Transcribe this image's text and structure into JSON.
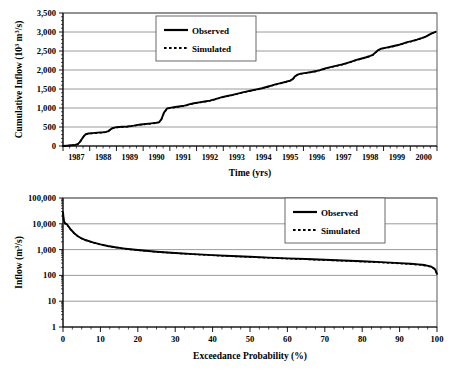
{
  "figure": {
    "title": "",
    "panels": [
      "cumulative-inflow-timeseries",
      "inflow-exceedance-probability"
    ]
  },
  "chart_data": [
    {
      "type": "line",
      "id": "cumulative-inflow",
      "title": "",
      "xlabel": "Time (yrs)",
      "ylabel": "Cumulative Inflow (10³ m³/s)",
      "ylabel_parts": {
        "main": "Cumulative Inflow (10",
        "sup": "3",
        "tail": "m",
        "sup2": "3",
        "tail2": "/s)"
      },
      "xlim": [
        1987,
        2001
      ],
      "ylim": [
        0,
        3500
      ],
      "yticks": [
        0,
        500,
        1000,
        1500,
        2000,
        2500,
        3000,
        3500
      ],
      "ytick_labels": [
        "0",
        "500",
        "1,000",
        "1,500",
        "2,000",
        "2,500",
        "3,000",
        "3,500"
      ],
      "xticks": [
        1987,
        1988,
        1989,
        1990,
        1991,
        1992,
        1993,
        1994,
        1995,
        1996,
        1997,
        1998,
        1999,
        2000
      ],
      "xtick_labels": [
        "1987",
        "1988",
        "1989",
        "1990",
        "1991",
        "1992",
        "1993",
        "1994",
        "1995",
        "1996",
        "1997",
        "1998",
        "1999",
        "2000"
      ],
      "grid": "horizontal",
      "legend_position": "top-center",
      "series": [
        {
          "name": "Observed",
          "style": "solid",
          "x": [
            1987.0,
            1987.15,
            1987.3,
            1987.45,
            1987.55,
            1987.62,
            1987.7,
            1987.78,
            1987.85,
            1987.95,
            1988.1,
            1988.3,
            1988.5,
            1988.6,
            1988.68,
            1988.75,
            1988.85,
            1989.0,
            1989.2,
            1989.4,
            1989.55,
            1989.65,
            1989.75,
            1989.9,
            1990.1,
            1990.3,
            1990.5,
            1990.6,
            1990.68,
            1990.78,
            1990.9,
            1991.05,
            1991.2,
            1991.4,
            1991.55,
            1991.65,
            1991.75,
            1991.9,
            1992.1,
            1992.3,
            1992.5,
            1992.6,
            1992.7,
            1992.8,
            1992.95,
            1993.15,
            1993.35,
            1993.5,
            1993.62,
            1993.72,
            1993.85,
            1994.05,
            1994.25,
            1994.45,
            1994.58,
            1994.68,
            1994.8,
            1994.95,
            1995.15,
            1995.35,
            1995.5,
            1995.6,
            1995.68,
            1995.78,
            1995.9,
            1996.1,
            1996.3,
            1996.5,
            1996.62,
            1996.72,
            1996.85,
            1997.05,
            1997.25,
            1997.45,
            1997.58,
            1997.68,
            1997.8,
            1997.95,
            1998.15,
            1998.35,
            1998.5,
            1998.6,
            1998.68,
            1998.78,
            1998.9,
            1999.1,
            1999.3,
            1999.5,
            1999.62,
            1999.72,
            1999.85,
            2000.05,
            2000.25,
            2000.45,
            2000.58,
            2000.68,
            2000.8,
            2000.95
          ],
          "y": [
            0,
            8,
            18,
            30,
            48,
            95,
            175,
            260,
            310,
            330,
            340,
            352,
            362,
            372,
            385,
            420,
            470,
            495,
            505,
            515,
            525,
            535,
            548,
            565,
            580,
            596,
            612,
            630,
            700,
            880,
            990,
            1010,
            1025,
            1045,
            1062,
            1080,
            1100,
            1125,
            1148,
            1170,
            1195,
            1215,
            1232,
            1255,
            1285,
            1315,
            1345,
            1372,
            1392,
            1410,
            1432,
            1460,
            1490,
            1520,
            1545,
            1565,
            1590,
            1620,
            1655,
            1690,
            1722,
            1760,
            1830,
            1880,
            1905,
            1925,
            1948,
            1975,
            1998,
            2020,
            2050,
            2082,
            2115,
            2148,
            2172,
            2195,
            2222,
            2258,
            2295,
            2335,
            2372,
            2400,
            2450,
            2515,
            2560,
            2588,
            2618,
            2650,
            2672,
            2695,
            2725,
            2760,
            2800,
            2845,
            2880,
            2920,
            2965,
            3005
          ]
        },
        {
          "name": "Simulated",
          "style": "dashed",
          "x": [
            1987.0,
            1987.15,
            1987.3,
            1987.45,
            1987.55,
            1987.62,
            1987.7,
            1987.78,
            1987.85,
            1987.95,
            1988.1,
            1988.3,
            1988.5,
            1988.6,
            1988.68,
            1988.75,
            1988.85,
            1989.0,
            1989.2,
            1989.4,
            1989.55,
            1989.65,
            1989.75,
            1989.9,
            1990.1,
            1990.3,
            1990.5,
            1990.6,
            1990.68,
            1990.78,
            1990.9,
            1991.05,
            1991.2,
            1991.4,
            1991.55,
            1991.65,
            1991.75,
            1991.9,
            1992.1,
            1992.3,
            1992.5,
            1992.6,
            1992.7,
            1992.8,
            1992.95,
            1993.15,
            1993.35,
            1993.5,
            1993.62,
            1993.72,
            1993.85,
            1994.05,
            1994.25,
            1994.45,
            1994.58,
            1994.68,
            1994.8,
            1994.95,
            1995.15,
            1995.35,
            1995.5,
            1995.6,
            1995.68,
            1995.78,
            1995.9,
            1996.1,
            1996.3,
            1996.5,
            1996.62,
            1996.72,
            1996.85,
            1997.05,
            1997.25,
            1997.45,
            1997.58,
            1997.68,
            1997.8,
            1997.95,
            1998.15,
            1998.35,
            1998.5,
            1998.6,
            1998.68,
            1998.78,
            1998.9,
            1999.1,
            1999.3,
            1999.5,
            1999.62,
            1999.72,
            1999.85,
            2000.05,
            2000.25,
            2000.45,
            2000.58,
            2000.68,
            2000.8,
            2000.95
          ],
          "y": [
            0,
            7,
            16,
            28,
            45,
            90,
            170,
            252,
            302,
            322,
            332,
            344,
            354,
            364,
            377,
            412,
            462,
            487,
            497,
            507,
            517,
            527,
            540,
            557,
            572,
            588,
            604,
            622,
            692,
            872,
            982,
            1002,
            1017,
            1037,
            1054,
            1072,
            1092,
            1117,
            1140,
            1162,
            1187,
            1207,
            1224,
            1247,
            1277,
            1307,
            1337,
            1364,
            1384,
            1402,
            1424,
            1452,
            1482,
            1512,
            1537,
            1557,
            1582,
            1612,
            1647,
            1682,
            1714,
            1752,
            1822,
            1872,
            1897,
            1917,
            1940,
            1967,
            1990,
            2012,
            2042,
            2074,
            2107,
            2140,
            2164,
            2187,
            2214,
            2250,
            2287,
            2327,
            2364,
            2392,
            2442,
            2507,
            2552,
            2580,
            2610,
            2642,
            2664,
            2687,
            2717,
            2752,
            2792,
            2837,
            2872,
            2912,
            2957,
            2997
          ]
        }
      ]
    },
    {
      "type": "line",
      "id": "flow-duration-curve",
      "title": "",
      "xlabel": "Exceedance Probability (%)",
      "ylabel": "Inflow (m³/s)",
      "ylabel_parts": {
        "main": "Inflow (m",
        "sup": "3",
        "tail": "/s)"
      },
      "xlim": [
        0,
        100
      ],
      "ylim": [
        1,
        100000
      ],
      "yscale": "log",
      "yticks": [
        1,
        10,
        100,
        1000,
        10000,
        100000
      ],
      "ytick_labels": [
        "1",
        "10",
        "100",
        "1,000",
        "10,000",
        "100,000"
      ],
      "xticks": [
        0,
        10,
        20,
        30,
        40,
        50,
        60,
        70,
        80,
        90,
        100
      ],
      "xtick_labels": [
        "0",
        "10",
        "20",
        "30",
        "40",
        "50",
        "60",
        "70",
        "80",
        "90",
        "100"
      ],
      "grid": "horizontal",
      "legend_position": "top-right",
      "series": [
        {
          "name": "Observed",
          "style": "solid",
          "x": [
            0,
            0.2,
            0.5,
            1,
            1.5,
            2,
            3,
            4,
            5,
            6,
            8,
            10,
            12,
            14,
            16,
            18,
            20,
            25,
            30,
            35,
            40,
            45,
            50,
            55,
            60,
            65,
            70,
            75,
            80,
            85,
            90,
            93,
            95,
            96,
            97,
            98,
            98.5,
            99,
            99.3,
            99.6,
            99.8,
            100
          ],
          "y": [
            28000,
            14000,
            10500,
            9800,
            7800,
            6200,
            4300,
            3300,
            2700,
            2350,
            1900,
            1600,
            1380,
            1230,
            1120,
            1030,
            960,
            830,
            740,
            670,
            610,
            565,
            525,
            490,
            458,
            430,
            402,
            378,
            352,
            328,
            300,
            282,
            268,
            258,
            246,
            228,
            216,
            198,
            182,
            160,
            135,
            115
          ]
        },
        {
          "name": "Simulated",
          "style": "dashed",
          "x": [
            0,
            0.2,
            0.5,
            1,
            1.5,
            2,
            3,
            4,
            5,
            6,
            8,
            10,
            12,
            14,
            16,
            18,
            20,
            25,
            30,
            35,
            40,
            45,
            50,
            55,
            60,
            65,
            70,
            75,
            80,
            85,
            90,
            93,
            95,
            96,
            97,
            98,
            98.5,
            99,
            99.3,
            99.6,
            99.8,
            100
          ],
          "y": [
            26000,
            13500,
            10200,
            9500,
            7600,
            6000,
            4200,
            3250,
            2650,
            2300,
            1870,
            1570,
            1350,
            1210,
            1100,
            1015,
            945,
            815,
            725,
            655,
            598,
            553,
            512,
            478,
            446,
            418,
            390,
            366,
            340,
            316,
            290,
            272,
            258,
            248,
            236,
            219,
            207,
            190,
            175,
            154,
            130,
            112
          ]
        }
      ]
    }
  ],
  "legend": {
    "observed": "Observed",
    "simulated": "Simulated"
  }
}
